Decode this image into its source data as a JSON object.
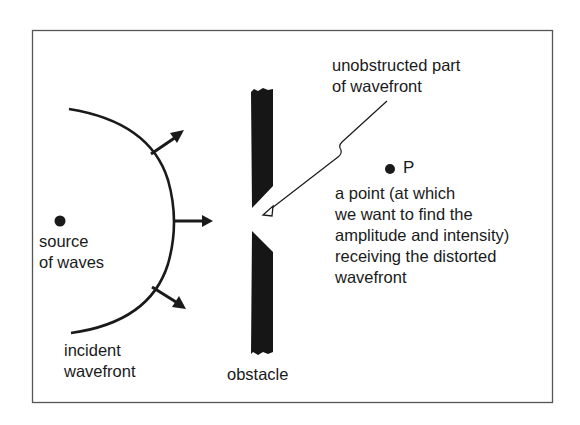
{
  "diagram": {
    "title": "",
    "colors": {
      "ink": "#1a1a1a",
      "frame": "#555555",
      "background": "#ffffff"
    },
    "labels": {
      "source": "source\nof waves",
      "incident_wavefront": "incident\nwavefront",
      "obstacle": "obstacle",
      "unobstructed": "unobstructed part\nof wavefront",
      "point_name": "P",
      "point_description": "a point (at which\nwe want to find the\namplitude and intensity)\nreceiving the distorted\nwavefront"
    },
    "nodes": [
      {
        "id": "source",
        "label": "source of waves",
        "shape": "dot"
      },
      {
        "id": "wavefront",
        "label": "incident wavefront",
        "shape": "arc"
      },
      {
        "id": "obstacle",
        "label": "obstacle",
        "shape": "bar-with-aperture"
      },
      {
        "id": "P",
        "label": "P",
        "shape": "dot"
      }
    ],
    "arrows": [
      {
        "from": "wavefront",
        "direction": "up-right",
        "meaning": "propagation"
      },
      {
        "from": "wavefront",
        "direction": "right",
        "meaning": "propagation"
      },
      {
        "from": "wavefront",
        "direction": "down-right",
        "meaning": "propagation"
      },
      {
        "from": "unobstructed-label",
        "to": "aperture",
        "style": "thin leader with hollow head"
      }
    ]
  }
}
